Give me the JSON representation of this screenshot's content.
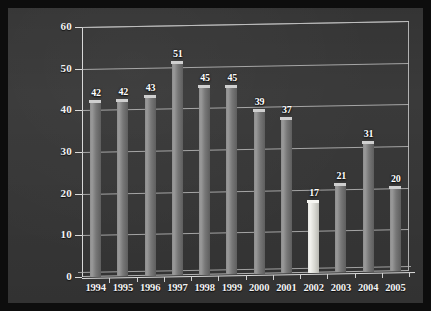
{
  "chart_data": {
    "type": "bar",
    "title": "",
    "subtitle": "",
    "xlabel": "",
    "ylabel": "",
    "categories": [
      "1994",
      "1995",
      "1996",
      "1997",
      "1998",
      "1999",
      "2000",
      "2001",
      "2002",
      "2003",
      "2004",
      "2005"
    ],
    "values": [
      42,
      42,
      43,
      51,
      45,
      45,
      39,
      37,
      17,
      21,
      31,
      20
    ],
    "data_labels": [
      "42",
      "42",
      "43",
      "51",
      "45",
      "45",
      "39",
      "37",
      "17",
      "21",
      "31",
      "20"
    ],
    "highlighted_category": "2002",
    "highlighted_index": 8,
    "ylim": [
      0,
      60
    ],
    "y_ticks": [
      0,
      10,
      20,
      30,
      40,
      50,
      60
    ],
    "y_tick_labels": [
      "0",
      "10",
      "20",
      "30",
      "40",
      "50",
      "60"
    ],
    "grid": true,
    "legend": "none",
    "legend_position": "none",
    "style": "3d-columns",
    "colors": {
      "background": "#3a3a3a",
      "frame": "#0d0d0d",
      "gridline": "#c0c0c0",
      "axis": "#d8d8d8",
      "bar": "#8e8e8e",
      "bar_highlight": "#f2f2ee",
      "text": "#f2f2f2"
    }
  }
}
